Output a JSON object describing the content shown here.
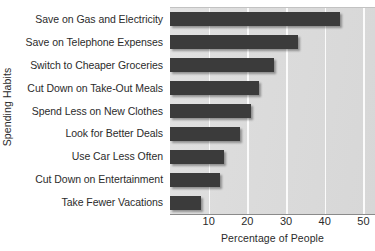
{
  "chart_data": {
    "type": "bar",
    "orientation": "horizontal",
    "title": "",
    "xlabel": "Percentage of People",
    "ylabel": "Spending Habits",
    "categories": [
      "Save on Gas and Electricity",
      "Save on Telephone Expenses",
      "Switch to Cheaper Groceries",
      "Cut Down on Take-Out Meals",
      "Spend Less on New Clothes",
      "Look for Better Deals",
      "Use Car Less Often",
      "Cut Down on Entertainment",
      "Take Fewer Vacations"
    ],
    "values": [
      44,
      33,
      27,
      23,
      21,
      18,
      14,
      13,
      8
    ],
    "xlim": [
      0,
      53
    ],
    "xticks": [
      10,
      20,
      30,
      40,
      50
    ],
    "xtick_labels": [
      "10",
      "20",
      "30",
      "40",
      "50"
    ],
    "grid": "vertical",
    "legend": "none",
    "bar_color": "#3b3b3b",
    "plot_background": "#dcdcdc",
    "gridline_color": "#fbfbfb"
  }
}
